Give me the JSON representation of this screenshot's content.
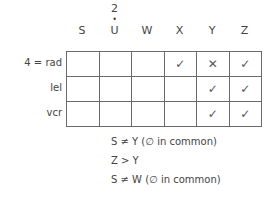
{
  "columns": [
    {
      "label": "S",
      "superscript": ""
    },
    {
      "label": "U",
      "superscript": "2",
      "dot": "•"
    },
    {
      "label": "W",
      "superscript": ""
    },
    {
      "label": "X",
      "superscript": ""
    },
    {
      "label": "Y",
      "superscript": ""
    },
    {
      "label": "Z",
      "superscript": ""
    }
  ],
  "rows": [
    {
      "label": "4 = rad",
      "cells": [
        "",
        "",
        "",
        "✓",
        "✕",
        "✓"
      ]
    },
    {
      "label": "lel",
      "cells": [
        "",
        "",
        "",
        "",
        "✓",
        "✓"
      ]
    },
    {
      "label": "vcr",
      "cells": [
        "",
        "",
        "",
        "",
        "✓",
        "✓"
      ]
    }
  ],
  "notes": [
    "S ≠ Y (∅ in common)",
    "Z > Y",
    "S ≠ W (∅ in common)"
  ]
}
